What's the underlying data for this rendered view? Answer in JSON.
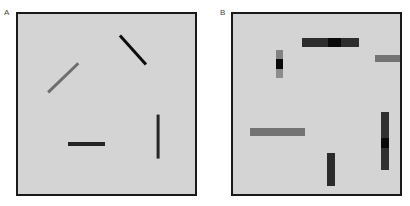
{
  "figure": {
    "width": 410,
    "height": 206,
    "background": "#ffffff"
  },
  "panels": [
    {
      "id": "panel-a",
      "label": "A",
      "label_x": 4,
      "label_y": 9,
      "x": 16,
      "y": 12,
      "width": 181,
      "height": 184,
      "background": "#d4d4d4",
      "border_color": "#1a1a1a",
      "border_width": 2,
      "elements": [
        {
          "name": "segment-gray-diagonal",
          "kind": "line",
          "x1": 48,
          "y1": 92,
          "x2": 78,
          "y2": 63,
          "thickness": 2.6,
          "color": "#6e6e6e"
        },
        {
          "name": "segment-black-diagonal",
          "kind": "line",
          "x1": 120,
          "y1": 35,
          "x2": 146,
          "y2": 64,
          "thickness": 2.8,
          "color": "#0d0d0d"
        },
        {
          "name": "segment-dark-horizontal",
          "kind": "line",
          "x1": 68,
          "y1": 144,
          "x2": 105,
          "y2": 144,
          "thickness": 3.2,
          "color": "#242424"
        },
        {
          "name": "segment-dark-vertical",
          "kind": "line",
          "x1": 158,
          "y1": 115,
          "x2": 158,
          "y2": 159,
          "thickness": 3.2,
          "color": "#262626"
        }
      ]
    },
    {
      "id": "panel-b",
      "label": "B",
      "label_x": 220,
      "label_y": 9,
      "x": 231,
      "y": 12,
      "width": 171,
      "height": 184,
      "background": "#d4d4d4",
      "border_color": "#1a1a1a",
      "border_width": 2,
      "elements": [
        {
          "name": "bar-top-horizontal-banded",
          "kind": "segbar",
          "orientation": "horiz",
          "x": 302,
          "y": 38,
          "width": 57,
          "height": 9,
          "segments": [
            {
              "size": 26,
              "color": "#2d2d2d"
            },
            {
              "size": 13,
              "color": "#0a0a0a"
            },
            {
              "size": 18,
              "color": "#2d2d2d"
            }
          ]
        },
        {
          "name": "bar-small-vertical-banded",
          "kind": "segbar",
          "orientation": "vert",
          "x": 276,
          "y": 50,
          "width": 7,
          "height": 28,
          "segments": [
            {
              "size": 9,
              "color": "#828282"
            },
            {
              "size": 10,
              "color": "#0a0a0a"
            },
            {
              "size": 9,
              "color": "#8c8c8c"
            }
          ]
        },
        {
          "name": "bar-right-gray-horizontal",
          "kind": "segbar",
          "orientation": "horiz",
          "x": 375,
          "y": 55,
          "width": 25,
          "height": 7,
          "segments": [
            {
              "size": 25,
              "color": "#737373"
            }
          ]
        },
        {
          "name": "bar-left-gray-horizontal",
          "kind": "segbar",
          "orientation": "horiz",
          "x": 250,
          "y": 128,
          "width": 55,
          "height": 8,
          "segments": [
            {
              "size": 55,
              "color": "#737373"
            }
          ]
        },
        {
          "name": "bar-tall-right-vertical-banded",
          "kind": "segbar",
          "orientation": "vert",
          "x": 381,
          "y": 112,
          "width": 8,
          "height": 58,
          "segments": [
            {
              "size": 26,
              "color": "#303030"
            },
            {
              "size": 10,
              "color": "#0a0a0a"
            },
            {
              "size": 22,
              "color": "#303030"
            }
          ]
        },
        {
          "name": "bar-bottom-vertical",
          "kind": "segbar",
          "orientation": "vert",
          "x": 327,
          "y": 153,
          "width": 8,
          "height": 33,
          "segments": [
            {
              "size": 33,
              "color": "#2b2b2b"
            }
          ]
        }
      ]
    }
  ]
}
